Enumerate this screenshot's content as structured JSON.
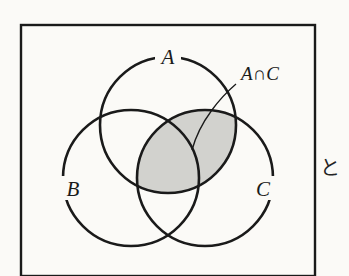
{
  "figure": {
    "kind": "venn-diagram",
    "background_color": "#fbfaf7",
    "stroke_color": "#1a1a1a",
    "shade_color": "#d2d2ce",
    "frame": {
      "name": "figure-border",
      "x": 21,
      "y": 25,
      "width": 294,
      "height": 251,
      "stroke_width": 2.4
    },
    "circles": [
      {
        "label": "A",
        "cx": 168,
        "cy": 125,
        "r": 68,
        "label_x": 168,
        "label_y": 64
      },
      {
        "label": "B",
        "cx": 131,
        "cy": 178,
        "r": 68,
        "label_x": 73,
        "label_y": 196
      },
      {
        "label": "C",
        "cx": 205,
        "cy": 178,
        "r": 68,
        "label_x": 263,
        "label_y": 196
      }
    ],
    "shaded_region": {
      "name": "a-intersect-c-region",
      "description": "lens formed by the intersection of circle A and circle C"
    },
    "annotation": {
      "label": "A∩C",
      "label_x": 241,
      "label_y": 80,
      "leader_path": "M 236 84 C 222 96 200 120 192 150"
    },
    "margin_text": {
      "label": "と",
      "x": 330,
      "y": 175
    }
  }
}
